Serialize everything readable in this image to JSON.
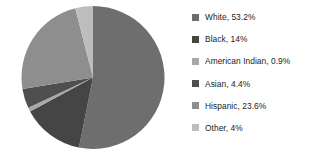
{
  "chart_data": {
    "type": "pie",
    "title": "",
    "categories": [
      "White",
      "Black",
      "American Indian",
      "Asian",
      "Hispanic",
      "Other"
    ],
    "values": [
      53.2,
      14,
      0.9,
      4.4,
      23.6,
      4
    ],
    "value_labels": [
      "53.2%",
      "14%",
      "0.9%",
      "4.4%",
      "23.6%",
      "4%"
    ],
    "legend_labels": [
      "White, 53.2%",
      "Black, 14%",
      "American Indian, 0.9%",
      "Asian, 4.4%",
      "Hispanic, 23.6%",
      "Other, 4%"
    ],
    "colors": [
      "#6e6e6e",
      "#454545",
      "#a8a8a8",
      "#4f4f4f",
      "#8e8e8e",
      "#bdbdbd"
    ],
    "legend_position": "right",
    "start_angle_deg": 0,
    "direction": "clockwise",
    "grid": false,
    "xlabel": "",
    "ylabel": ""
  },
  "legend": {
    "items": [
      {
        "label": "White, 53.2%",
        "color": "#6e6e6e",
        "swatch_name": "legend-swatch-white"
      },
      {
        "label": "Black, 14%",
        "color": "#454545",
        "swatch_name": "legend-swatch-black"
      },
      {
        "label": "American Indian, 0.9%",
        "color": "#a8a8a8",
        "swatch_name": "legend-swatch-american-indian"
      },
      {
        "label": "Asian, 4.4%",
        "color": "#4f4f4f",
        "swatch_name": "legend-swatch-asian"
      },
      {
        "label": "Hispanic, 23.6%",
        "color": "#8e8e8e",
        "swatch_name": "legend-swatch-hispanic"
      },
      {
        "label": "Other, 4%",
        "color": "#bdbdbd",
        "swatch_name": "legend-swatch-other"
      }
    ]
  }
}
